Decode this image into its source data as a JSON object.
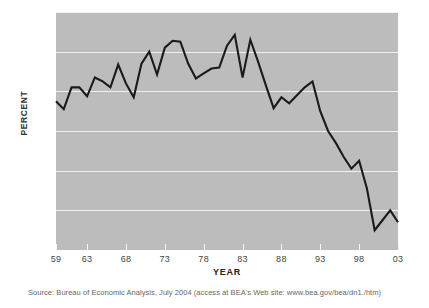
{
  "chart_data": {
    "type": "line",
    "title": "",
    "xlabel": "YEAR",
    "ylabel": "PERCENT",
    "xlim": [
      1959,
      2003
    ],
    "ylim": [
      0,
      12
    ],
    "grid": true,
    "legend": null,
    "x_tick_labels": [
      "59",
      "63",
      "68",
      "73",
      "78",
      "83",
      "88",
      "93",
      "98",
      "03"
    ],
    "x_tick_values": [
      1959,
      1963,
      1968,
      1973,
      1978,
      1983,
      1988,
      1993,
      1998,
      2003
    ],
    "y_tick_labels": [
      "2",
      "4",
      "6",
      "8",
      "10",
      "12"
    ],
    "y_tick_values": [
      2,
      4,
      6,
      8,
      10,
      12
    ],
    "x": [
      1959,
      1960,
      1961,
      1962,
      1963,
      1964,
      1965,
      1966,
      1967,
      1968,
      1969,
      1970,
      1971,
      1972,
      1973,
      1974,
      1975,
      1976,
      1977,
      1978,
      1979,
      1980,
      1981,
      1982,
      1983,
      1984,
      1985,
      1986,
      1987,
      1988,
      1989,
      1990,
      1991,
      1992,
      1993,
      1994,
      1995,
      1996,
      1997,
      1998,
      1999,
      2000,
      2001,
      2002,
      2003
    ],
    "values": [
      7.5,
      7.1,
      8.2,
      8.2,
      7.75,
      8.7,
      8.5,
      8.2,
      9.35,
      8.4,
      7.7,
      9.4,
      10.0,
      8.85,
      10.2,
      10.55,
      10.5,
      9.4,
      8.65,
      8.9,
      9.15,
      9.2,
      10.3,
      10.85,
      8.7,
      10.6,
      9.5,
      8.3,
      7.15,
      7.7,
      7.4,
      7.8,
      8.2,
      8.5,
      7.0,
      6.0,
      5.4,
      4.7,
      4.1,
      4.5,
      3.1,
      1.0,
      1.5,
      2.0,
      1.4
    ],
    "series_color": "#1a1a1a",
    "plot_background": "#bcbcbc",
    "gridline_color": "#f0f0f0",
    "annotations": []
  },
  "source": {
    "text": "Source: Bureau of Economic Analysis, July 2004 (access at BEA's Web site: www.bea.gov/bea/dn1./htm)"
  }
}
